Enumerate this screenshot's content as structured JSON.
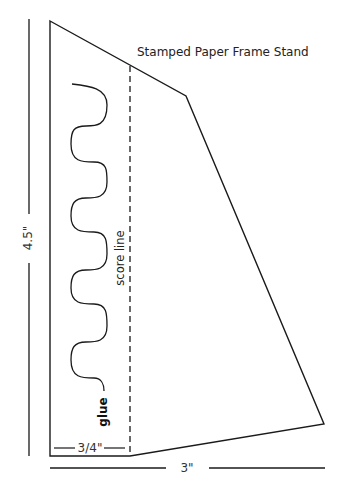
{
  "diagram": {
    "title": "Stamped Paper Frame Stand",
    "labels": {
      "height": "4.5\"",
      "width": "3\"",
      "flap_width": "3/4\"",
      "score_line": "score line",
      "glue": "glue"
    },
    "colors": {
      "stroke": "#1a1a1a",
      "background": "#ffffff"
    },
    "shape": {
      "outline_points": [
        [
          50,
          21
        ],
        [
          186,
          96
        ],
        [
          324,
          424
        ],
        [
          130,
          456
        ],
        [
          50,
          456
        ]
      ],
      "score_line_x": 130,
      "score_line_top_y": 65,
      "score_line_bottom_y": 456
    }
  }
}
